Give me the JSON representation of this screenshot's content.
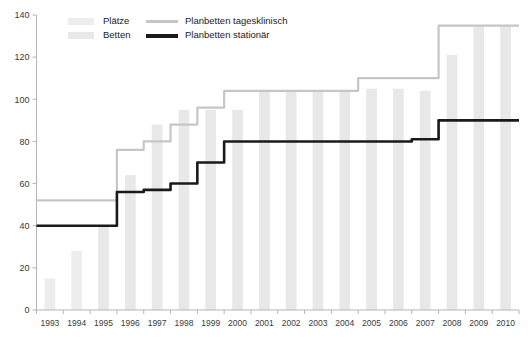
{
  "chart_data": {
    "type": "bar",
    "title": "",
    "subtitle": "",
    "xlabel": "",
    "ylabel": "",
    "categories": [
      "1993",
      "1994",
      "1995",
      "1996",
      "1997",
      "1998",
      "1999",
      "2000",
      "2001",
      "2002",
      "2003",
      "2004",
      "2005",
      "2006",
      "2007",
      "2008",
      "2009",
      "2010"
    ],
    "ylim": [
      0,
      140
    ],
    "yticks": [
      0,
      20,
      40,
      60,
      80,
      100,
      120,
      140
    ],
    "grid": false,
    "legend_position": "top-left",
    "series": [
      {
        "name": "Plätze",
        "type": "bar",
        "color": "#ededed",
        "values": [
          15,
          28,
          0,
          0,
          0,
          0,
          0,
          0,
          0,
          0,
          0,
          0,
          0,
          0,
          0,
          0,
          0,
          0
        ]
      },
      {
        "name": "Betten",
        "type": "bar",
        "color": "#e8e8e8",
        "values": [
          0,
          0,
          40,
          64,
          88,
          95,
          95,
          95,
          104,
          104,
          104,
          104,
          105,
          105,
          104,
          121,
          135,
          135
        ]
      },
      {
        "name": "Planbetten tagesklinisch",
        "type": "line",
        "color": "#c6c6c6",
        "values": [
          52,
          52,
          52,
          76,
          80,
          88,
          96,
          104,
          104,
          104,
          104,
          104,
          110,
          110,
          110,
          135,
          135,
          135
        ]
      },
      {
        "name": "Planbetten stationär",
        "type": "line",
        "color": "#1a1a1a",
        "values": [
          40,
          40,
          40,
          56,
          57,
          60,
          70,
          80,
          80,
          80,
          80,
          80,
          80,
          80,
          81,
          90,
          90,
          90
        ]
      }
    ]
  },
  "legend": {
    "items": [
      {
        "label": "Plätze",
        "marker": "swatch",
        "color": "#ededed"
      },
      {
        "label": "Betten",
        "marker": "swatch",
        "color": "#e8e8e8"
      },
      {
        "label": "Planbetten tagesklinisch",
        "marker": "line",
        "color": "#c6c6c6"
      },
      {
        "label": "Planbetten stationär",
        "marker": "line",
        "color": "#1a1a1a"
      }
    ]
  },
  "axes": {
    "y_tick_labels": [
      "140",
      "120",
      "100",
      "80",
      "60",
      "40",
      "20",
      "0"
    ],
    "x_tick_labels": [
      "1993",
      "1994",
      "1995",
      "1996",
      "1997",
      "1998",
      "1999",
      "2000",
      "2001",
      "2002",
      "2003",
      "2004",
      "2005",
      "2006",
      "2007",
      "2008",
      "2009",
      "2010"
    ]
  },
  "colors": {
    "axis": "#b5b5b5",
    "bar_platze": "#ededed",
    "bar_betten": "#e8e8e8",
    "line_tagesklinisch": "#c6c6c6",
    "line_stationaer": "#1a1a1a",
    "text": "#3a3a3a"
  }
}
